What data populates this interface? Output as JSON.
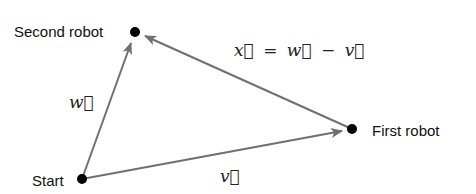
{
  "diagram": {
    "points": {
      "start": {
        "label": "Start",
        "x": 82,
        "y": 179
      },
      "second": {
        "label": "Second robot",
        "x": 135,
        "y": 32
      },
      "first": {
        "label": "First robot",
        "x": 352,
        "y": 129
      }
    },
    "vectors": {
      "w": {
        "label": "w⃗",
        "from": "start",
        "to": "second"
      },
      "v": {
        "label": "v⃗",
        "from": "start",
        "to": "first"
      },
      "x": {
        "label": "x⃗",
        "from": "first",
        "to": "second"
      }
    },
    "equation": "x⃗ = w⃗ − v⃗",
    "colors": {
      "line": "#707070",
      "point": "#000000"
    }
  }
}
